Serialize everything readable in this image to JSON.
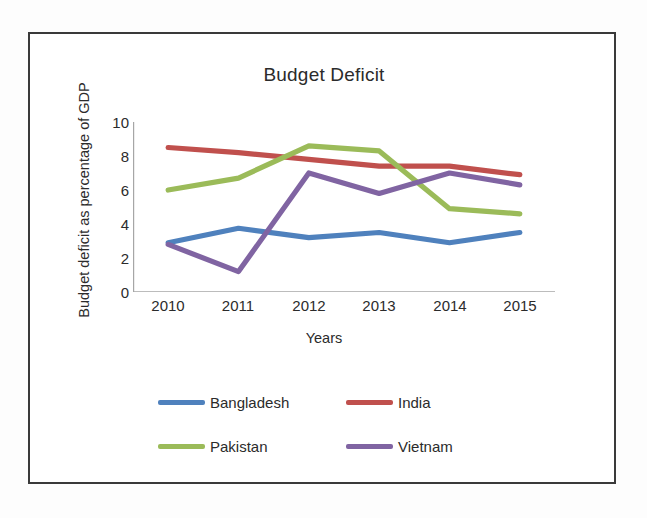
{
  "chart_data": {
    "type": "line",
    "title": "Budget Deficit",
    "xlabel": "Years",
    "ylabel": "Budget deficit as percentage of GDP",
    "categories": [
      "2010",
      "2011",
      "2012",
      "2013",
      "2014",
      "2015"
    ],
    "x": [
      2010,
      2011,
      2012,
      2013,
      2014,
      2015
    ],
    "ylim": [
      0,
      10
    ],
    "yticks": [
      0,
      2,
      4,
      6,
      8,
      10
    ],
    "grid": false,
    "legend_position": "bottom",
    "series": [
      {
        "name": "Bangladesh",
        "color": "#4f81bd",
        "values": [
          2.9,
          3.75,
          3.2,
          3.5,
          2.9,
          3.5
        ]
      },
      {
        "name": "India",
        "color": "#c0504d",
        "values": [
          8.5,
          8.2,
          7.8,
          7.4,
          7.4,
          6.9
        ]
      },
      {
        "name": "Pakistan",
        "color": "#9bbb59",
        "values": [
          6.0,
          6.7,
          8.6,
          8.3,
          4.9,
          4.6
        ]
      },
      {
        "name": "Vietnam",
        "color": "#8064a2",
        "values": [
          2.8,
          1.2,
          7.0,
          5.8,
          7.0,
          6.3
        ]
      }
    ]
  },
  "axis": {
    "y_tick_labels": [
      "10",
      "8",
      "6",
      "4",
      "2",
      "0"
    ],
    "x_tick_labels": [
      "2010",
      "2011",
      "2012",
      "2013",
      "2014",
      "2015"
    ]
  },
  "legend": {
    "items": [
      {
        "label": "Bangladesh",
        "color": "#4f81bd"
      },
      {
        "label": "India",
        "color": "#c0504d"
      },
      {
        "label": "Pakistan",
        "color": "#9bbb59"
      },
      {
        "label": "Vietnam",
        "color": "#8064a2"
      }
    ]
  },
  "style": {
    "axis_color": "#a6a6a6",
    "text_color": "#2b2b2b",
    "frame_color": "#3a3a3a",
    "background": "#ffffff"
  }
}
